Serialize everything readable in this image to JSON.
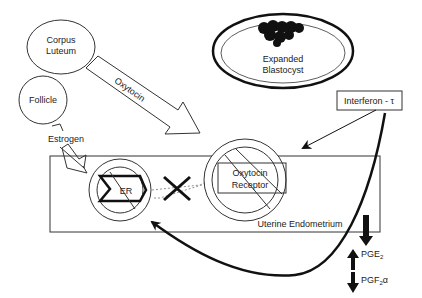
{
  "diagram": {
    "nodes": {
      "corpus_luteum": {
        "line1": "Corpus",
        "line2": "Luteum"
      },
      "follicle": {
        "label": "Follicle"
      },
      "blastocyst": {
        "line1": "Expanded",
        "line2": "Blastocyst"
      },
      "interferon": {
        "label": "Interferon - τ"
      },
      "er": {
        "label": "ER"
      },
      "oxytocin_receptor": {
        "line1": "Oxytocin",
        "line2": "Receptor"
      },
      "endometrium": {
        "label": "Uterine Endometrium"
      }
    },
    "arrows": {
      "oxytocin": {
        "label": "Oxytocin"
      },
      "estrogen": {
        "label": "Estrogen"
      }
    },
    "prostaglandins": {
      "pge2": {
        "base": "PGE",
        "sub": "2",
        "direction": "up"
      },
      "pgf2a": {
        "base": "PGF",
        "sub": "2",
        "suffix": "α",
        "direction": "down"
      }
    }
  }
}
